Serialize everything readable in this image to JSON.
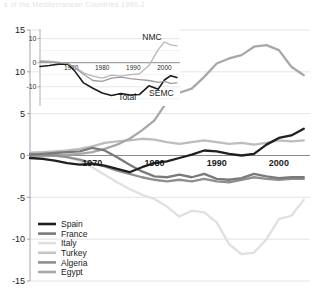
{
  "top_cut_text": "s of the Mediterranean Countries 1960-2005",
  "chart_data": {
    "type": "line",
    "title": "",
    "xlabel": "",
    "ylabel": "",
    "xlim": [
      1960,
      2005
    ],
    "ylim": [
      -15,
      15
    ],
    "grid": true,
    "x_ticks": [
      1970,
      1980,
      1990,
      2000
    ],
    "y_ticks": [
      15,
      10,
      5,
      0,
      -5,
      -10,
      -15
    ],
    "legend_position": "bottom-left",
    "colors": {
      "Spain": "#1f1f1f",
      "France": "#7a7a7a",
      "Italy": "#e0e0e0",
      "Turkey": "#a8a8a8",
      "Algeria": "#8f8f8f",
      "Egypt": "#bdbdbd",
      "gridline": "#d8d8d8",
      "axis": "#9a9a9a",
      "zeroline": "#7d7d7d"
    },
    "x": [
      1960,
      1962,
      1964,
      1966,
      1968,
      1970,
      1972,
      1974,
      1976,
      1978,
      1980,
      1982,
      1984,
      1986,
      1988,
      1990,
      1992,
      1994,
      1996,
      1998,
      2000,
      2002,
      2004
    ],
    "series": [
      {
        "name": "Spain",
        "values": [
          -0.3,
          -0.4,
          -0.6,
          -0.9,
          -1.1,
          -1.0,
          -1.2,
          -1.6,
          -2.0,
          -1.4,
          -0.9,
          -0.7,
          -0.3,
          0.1,
          0.6,
          0.5,
          0.2,
          0.0,
          0.2,
          1.3,
          2.1,
          2.4,
          3.2
        ]
      },
      {
        "name": "France",
        "values": [
          0.1,
          0.2,
          0.3,
          0.4,
          0.5,
          0.9,
          0.6,
          -0.2,
          -1.1,
          -1.9,
          -2.5,
          -2.6,
          -2.3,
          -2.6,
          -2.2,
          -2.8,
          -2.9,
          -2.7,
          -2.2,
          -2.5,
          -2.7,
          -2.6,
          -2.6
        ]
      },
      {
        "name": "Italy",
        "values": [
          0.4,
          0.3,
          0.1,
          -0.2,
          -0.7,
          -1.4,
          -2.3,
          -3.2,
          -4.0,
          -4.7,
          -5.2,
          -6.1,
          -7.3,
          -6.6,
          -6.8,
          -8.0,
          -10.6,
          -11.8,
          -11.6,
          -10.0,
          -7.6,
          -7.2,
          -5.3
        ]
      },
      {
        "name": "Turkey",
        "values": [
          -0.2,
          -0.1,
          0.0,
          0.1,
          0.2,
          0.4,
          0.8,
          1.3,
          2.0,
          3.0,
          4.2,
          6.4,
          7.5,
          8.0,
          9.4,
          11.0,
          11.6,
          12.0,
          13.0,
          13.2,
          12.6,
          10.6,
          9.6
        ]
      },
      {
        "name": "Algeria",
        "values": [
          0.2,
          0.1,
          0.0,
          -0.2,
          -0.5,
          -0.9,
          -1.3,
          -1.8,
          -2.2,
          -2.6,
          -2.9,
          -3.1,
          -2.9,
          -3.1,
          -2.8,
          -3.1,
          -3.2,
          -2.9,
          -2.6,
          -2.8,
          -2.9,
          -2.8,
          -2.8
        ]
      },
      {
        "name": "Egypt",
        "values": [
          0.3,
          0.4,
          0.5,
          0.6,
          0.8,
          1.1,
          1.5,
          1.7,
          1.8,
          2.0,
          1.9,
          1.6,
          1.4,
          1.6,
          1.8,
          1.6,
          1.4,
          1.5,
          1.3,
          1.5,
          1.8,
          1.7,
          1.8
        ]
      }
    ],
    "legend": [
      {
        "label": "Spain",
        "color": "#1f1f1f"
      },
      {
        "label": "France",
        "color": "#7a7a7a"
      },
      {
        "label": "Italy",
        "color": "#e0e0e0"
      },
      {
        "label": "Turkey",
        "color": "#c4c4c4"
      },
      {
        "label": "Algeria",
        "color": "#8f8f8f"
      },
      {
        "label": "Egypt",
        "color": "#a8a8a8"
      }
    ],
    "inset": {
      "type": "line",
      "xlim": [
        1960,
        2005
      ],
      "ylim": [
        -18,
        14
      ],
      "x_ticks": [
        1970,
        1980,
        1990,
        2000
      ],
      "y_ticks": [
        10,
        0,
        -10
      ],
      "annotations": [
        {
          "text": "NMC",
          "x": 1996,
          "y": 9.5
        },
        {
          "text": "Total",
          "x": 1988,
          "y": -15.5
        },
        {
          "text": "SEMC",
          "x": 1999,
          "y": -14.0
        }
      ],
      "x": [
        1960,
        1963,
        1966,
        1969,
        1971,
        1974,
        1977,
        1980,
        1983,
        1986,
        1989,
        1992,
        1995,
        1998,
        2000,
        2002,
        2004
      ],
      "series": [
        {
          "name": "NMC",
          "color": "#b8b8b8",
          "values": [
            0.8,
            0.6,
            0.2,
            -0.6,
            -1.6,
            -4.2,
            -5.6,
            -6.4,
            -5.2,
            -5.6,
            -5.0,
            -4.6,
            -1.2,
            5.4,
            8.6,
            7.4,
            7.0
          ]
        },
        {
          "name": "Total",
          "color": "#1a1a1a",
          "values": [
            -1.6,
            -1.2,
            -0.6,
            -0.6,
            -3.2,
            -8.4,
            -10.6,
            -12.6,
            -13.6,
            -12.8,
            -13.4,
            -13.2,
            -9.6,
            -11.0,
            -7.2,
            -5.4,
            -6.2
          ]
        },
        {
          "name": "SEMC",
          "color": "#9c9c9c",
          "values": [
            0.4,
            0.2,
            0.0,
            -0.4,
            -2.0,
            -4.8,
            -7.4,
            -7.8,
            -6.4,
            -6.0,
            -6.6,
            -7.0,
            -7.4,
            -8.2,
            -7.8,
            -8.6,
            -8.4
          ]
        }
      ]
    }
  }
}
